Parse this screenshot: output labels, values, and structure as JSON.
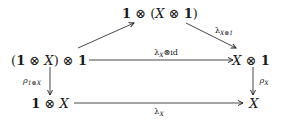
{
  "diagram": {
    "type": "commutative-diagram",
    "nodes": {
      "top": {
        "pre": "1",
        "op1": " ⊗ (",
        "x": "X",
        "op2": " ⊗ ",
        "one": "1",
        "post": ")"
      },
      "mid_left": {
        "open": "(",
        "one": "1",
        "op1": " ⊗ ",
        "x": "X",
        "close": ")",
        "op2": " ⊗ ",
        "one2": "1"
      },
      "mid_right": {
        "x": "X",
        "op": " ⊗ ",
        "one": "1"
      },
      "bottom_left": {
        "one": "1",
        "op": " ⊗ ",
        "x": "X"
      },
      "bottom_right": {
        "x": "X"
      }
    },
    "arrows": {
      "left_to_top": {
        "label": ""
      },
      "top_to_right": {
        "label_main": "λ",
        "label_sub": "X⊗1"
      },
      "mid_horizontal": {
        "label_main": "λ",
        "label_sub": "X",
        "label_rest": "⊗id"
      },
      "left_vertical": {
        "label_main": "ρ",
        "label_sub": "1⊗X"
      },
      "right_vertical": {
        "label_main": "ρ",
        "label_sub": "X"
      },
      "bottom_horizontal": {
        "label_main": "λ",
        "label_sub": "X"
      }
    },
    "colors": {
      "ink": "#1a1a1a",
      "background": "#ffffff"
    }
  }
}
